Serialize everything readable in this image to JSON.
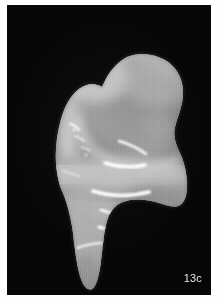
{
  "figure": {
    "label": "13c",
    "caption_text": "13c",
    "view": "lateral"
  },
  "plate": {
    "background_color": "#fefefe",
    "photo_background_color": "#060606",
    "photo_left": 7,
    "photo_top": 5,
    "photo_width": 204,
    "photo_height": 290
  },
  "specimen": {
    "name": "molar-tooth",
    "description": "Enamel crown with occlusal basin above, root and cervical flare below",
    "body_color": "#a9a9a9",
    "midtone_color": "#9b9b9b",
    "shadow_color": "#6f6f6f",
    "highlight_color": "#f2f2f2",
    "rim_color": "#d6d6d6",
    "specular_color": "#ffffff",
    "parts": [
      {
        "name": "crown-apex",
        "tone": "#b2b2b2"
      },
      {
        "name": "occlusal-basin",
        "tone": "#9a9a9a"
      },
      {
        "name": "buccal-face",
        "tone": "#a6a6a6"
      },
      {
        "name": "cervical-bulge",
        "tone": "#b5b5b5"
      },
      {
        "name": "root-shaft",
        "tone": "#a0a0a0"
      },
      {
        "name": "root-tip",
        "tone": "#8d8d8d"
      }
    ],
    "speculars": [
      {
        "name": "basin-rim-glint",
        "length": "short"
      },
      {
        "name": "upper-streak",
        "length": "medium"
      },
      {
        "name": "mid-streak",
        "length": "long"
      },
      {
        "name": "lower-streak-a",
        "length": "short"
      },
      {
        "name": "lower-streak-b",
        "length": "medium"
      },
      {
        "name": "root-edge-glint",
        "length": "short"
      }
    ]
  }
}
